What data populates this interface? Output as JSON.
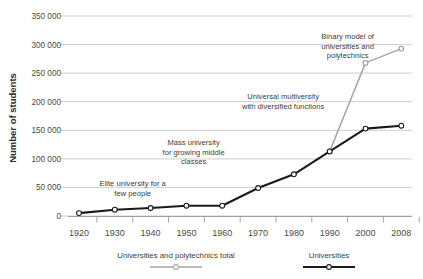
{
  "chart_data": {
    "type": "line",
    "title": "",
    "xlabel": "",
    "ylabel": "Number of students",
    "ylim": [
      0,
      350000
    ],
    "yticks": [
      "0",
      "50 000",
      "100 000",
      "150 000",
      "200 000",
      "250 000",
      "300 000",
      "350 000"
    ],
    "ytick_values": [
      0,
      50000,
      100000,
      150000,
      200000,
      250000,
      300000,
      350000
    ],
    "grid": "horizontal",
    "legend_position": "bottom",
    "categories": [
      "1920",
      "1930",
      "1940",
      "1950",
      "1960",
      "1970",
      "1980",
      "1990",
      "2000",
      "2008"
    ],
    "x": [
      1920,
      1930,
      1940,
      1950,
      1960,
      1970,
      1980,
      1990,
      2000,
      2008
    ],
    "series": [
      {
        "name": "Universities and polytechnics total",
        "color": "#a6a6a6",
        "values": [
          null,
          null,
          null,
          null,
          null,
          null,
          null,
          113000,
          268000,
          293000
        ]
      },
      {
        "name": "Universities",
        "color": "#1a1a1a",
        "values": [
          5000,
          11000,
          14000,
          18000,
          18000,
          49000,
          73000,
          113000,
          153000,
          158000
        ]
      }
    ],
    "annotations": [
      {
        "id": "elite-university",
        "lines": [
          "Elite university for a",
          "few people"
        ],
        "x": 1935,
        "y": 52000
      },
      {
        "id": "mass-university",
        "lines": [
          "Mass university",
          "for growing middle",
          "classes"
        ],
        "x": 1952,
        "y": 124000
      },
      {
        "id": "universal-multiversity",
        "lines": [
          "Universal multiversity",
          "with diversified functions"
        ],
        "x": 1977,
        "y": 205000
      },
      {
        "id": "binary-model",
        "lines": [
          "Binary model of",
          "universities and",
          "polytechnics"
        ],
        "x": 1995,
        "y": 310000
      }
    ]
  },
  "legend": {
    "items": [
      {
        "label": "Universities and polytechnics total",
        "color": "#a6a6a6",
        "marker": "open-circle"
      },
      {
        "label": "Universities",
        "color": "#1a1a1a",
        "marker": "open-circle"
      }
    ]
  },
  "annotation_text": {
    "elite_line_1": "Elite university for a",
    "elite_line_2": "few people",
    "mass_line_1": "Mass university",
    "mass_line_2": "for growing middle",
    "mass_line_3": "classes",
    "universal_line_1": "Universal multiversity",
    "universal_line_2": "with diversified functions",
    "binary_line_1": "Binary model of",
    "binary_line_2": "universities and",
    "binary_line_3": "polytechnics"
  },
  "axes": {
    "y_title": "Number of students",
    "y_ticks": [
      "350 000",
      "300 000",
      "250 000",
      "200 000",
      "150 000",
      "100 000",
      "50 000",
      "0"
    ],
    "x_ticks": [
      "1920",
      "1930",
      "1940",
      "1950",
      "1960",
      "1970",
      "1980",
      "1990",
      "2000",
      "2008"
    ]
  },
  "colors": {
    "universities": "#1a1a1a",
    "total": "#a6a6a6",
    "grid": "#b8b8b8",
    "text": "#3d3d3d",
    "background": "#ffffff"
  }
}
